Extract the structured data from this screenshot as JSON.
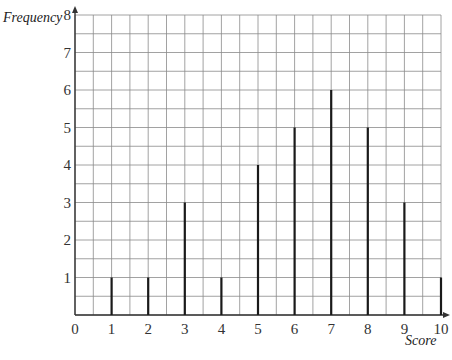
{
  "chart_data": {
    "type": "bar",
    "style": "vertical-line (stick) chart on square grid paper",
    "title": "",
    "xlabel": "Score",
    "ylabel": "Frequency",
    "categories": [
      1,
      2,
      3,
      4,
      5,
      6,
      7,
      8,
      9,
      10
    ],
    "values": [
      1,
      1,
      3,
      1,
      4,
      5,
      6,
      5,
      3,
      1
    ],
    "x_ticks": [
      "0",
      "1",
      "2",
      "3",
      "4",
      "5",
      "6",
      "7",
      "8",
      "9",
      "10"
    ],
    "y_ticks": [
      "1",
      "2",
      "3",
      "4",
      "5",
      "6",
      "7",
      "8"
    ],
    "xlim": [
      0,
      10
    ],
    "ylim": [
      0,
      8
    ],
    "grid": true,
    "grid_step": 0.5,
    "legend": null
  },
  "colors": {
    "grid": "#8a8a8a",
    "axis": "#333333",
    "bar": "#1a1a1a",
    "background": "#ffffff"
  }
}
